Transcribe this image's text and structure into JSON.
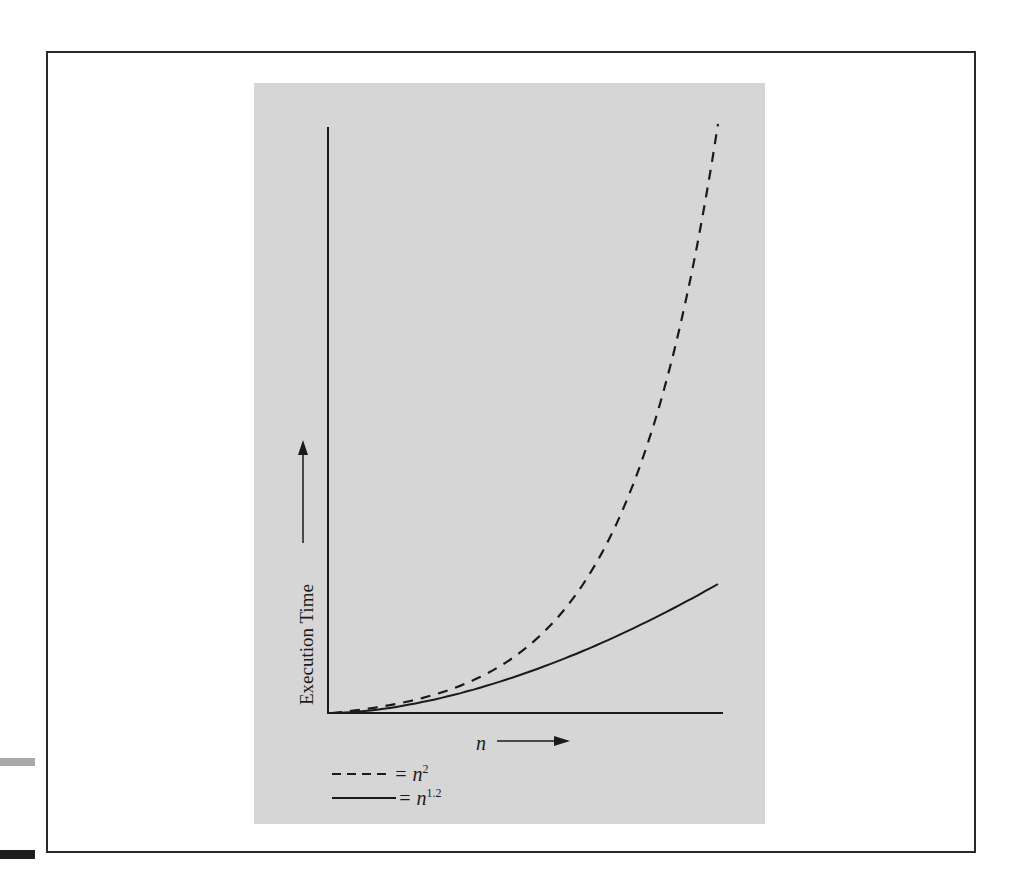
{
  "chart_data": {
    "type": "line",
    "title": "",
    "xlabel": "n",
    "ylabel": "Execution Time",
    "x": [
      0,
      0.1,
      0.2,
      0.3,
      0.4,
      0.5,
      0.6,
      0.7,
      0.8,
      0.9,
      1.0
    ],
    "series": [
      {
        "name": "n^2",
        "style": "dashed",
        "legend": "= n",
        "exponent": "2",
        "values_relative": [
          0,
          0.01,
          0.04,
          0.09,
          0.16,
          0.25,
          0.36,
          0.49,
          0.64,
          0.81,
          1.0
        ]
      },
      {
        "name": "n^1.2",
        "style": "solid",
        "legend": "= n",
        "exponent": "1.2",
        "values_relative": [
          0,
          0.02,
          0.05,
          0.08,
          0.12,
          0.16,
          0.2,
          0.24,
          0.27,
          0.3,
          0.33
        ]
      }
    ],
    "ticks": "none",
    "grid": false,
    "legend_position": "bottom-left"
  },
  "axes": {
    "y_label": "Execution Time",
    "x_label": "n"
  },
  "legend": [
    {
      "line": "dashed",
      "text": "= n",
      "sup": "2"
    },
    {
      "line": "solid",
      "text": "= n",
      "sup": "1.2"
    }
  ],
  "colors": {
    "panel": "#d6d6d6",
    "ink": "#1a1a1a",
    "frame": "#2a2a2a"
  }
}
